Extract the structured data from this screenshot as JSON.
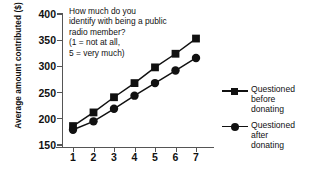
{
  "chart_data": {
    "type": "line",
    "title": "",
    "xlabel": "",
    "ylabel": "Average amount contributed ($)",
    "x": [
      1,
      2,
      3,
      4,
      5,
      6,
      7
    ],
    "xticklabels": [
      "1",
      "2",
      "3",
      "4",
      "5",
      "6",
      "7"
    ],
    "yticklabels": [
      "150",
      "200",
      "250",
      "300",
      "350",
      "400"
    ],
    "yticks": [
      150,
      200,
      250,
      300,
      350,
      400
    ],
    "ylim": [
      150,
      400
    ],
    "xlim": [
      0.55,
      7.55
    ],
    "grid": false,
    "legend_position": "right",
    "series": [
      {
        "name": "Questioned before donating",
        "marker": "square",
        "color": "#111111",
        "values": [
          185,
          211,
          240,
          267,
          297,
          323,
          352
        ]
      },
      {
        "name": "Questioned after donating",
        "marker": "circle",
        "color": "#111111",
        "values": [
          178,
          194,
          218,
          243,
          267,
          291,
          315
        ]
      }
    ],
    "annotations": [
      "How much do you",
      "identify with being a public",
      "radio member?",
      "(1 = not at all,",
      "5 = very much)"
    ]
  },
  "legend": {
    "items": [
      {
        "line1": "Questioned",
        "line2": "before",
        "line3": "donating",
        "marker": "square-marker"
      },
      {
        "line1": "Questioned",
        "line2": "after",
        "line3": "donating",
        "marker": "circle-marker"
      }
    ]
  }
}
